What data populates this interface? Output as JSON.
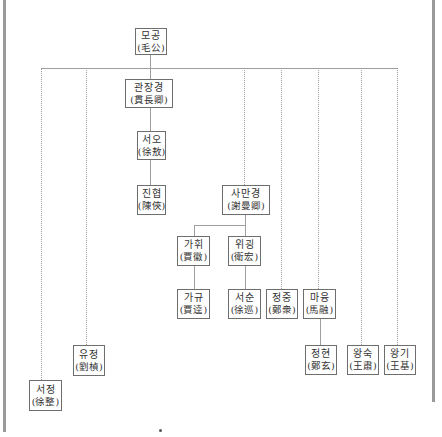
{
  "diagram": {
    "type": "family-lineage-tree",
    "nodes": [
      {
        "id": "mogong",
        "korean": "모공",
        "hanja": "(毛公)"
      },
      {
        "id": "gwanjanggyeong",
        "korean": "관장경",
        "hanja": "(貫長卿)"
      },
      {
        "id": "seoo",
        "korean": "서오",
        "hanja": "(徐敖)"
      },
      {
        "id": "jinhyeop",
        "korean": "진협",
        "hanja": "(陳俠)"
      },
      {
        "id": "samangyeong",
        "korean": "사만경",
        "hanja": "(謝曼卿)"
      },
      {
        "id": "gahwi",
        "korean": "가휘",
        "hanja": "(賈徽)"
      },
      {
        "id": "wigoeng",
        "korean": "위굉",
        "hanja": "(衛宏)"
      },
      {
        "id": "gagyu",
        "korean": "가규",
        "hanja": "(賈逵)"
      },
      {
        "id": "seosun",
        "korean": "서순",
        "hanja": "(徐巡)"
      },
      {
        "id": "jeongjung",
        "korean": "정중",
        "hanja": "(鄭衆)"
      },
      {
        "id": "mayung",
        "korean": "마융",
        "hanja": "(馬融)"
      },
      {
        "id": "jeonghyeon",
        "korean": "정현",
        "hanja": "(鄭玄)"
      },
      {
        "id": "wangsuk",
        "korean": "왕숙",
        "hanja": "(王肅)"
      },
      {
        "id": "wanggi",
        "korean": "왕기",
        "hanja": "(王基)"
      },
      {
        "id": "yujeong",
        "korean": "유정",
        "hanja": "(劉楨)"
      },
      {
        "id": "seojeong",
        "korean": "서정",
        "hanja": "(徐整)"
      }
    ],
    "edges": [
      [
        "mogong",
        "gwanjanggyeong"
      ],
      [
        "gwanjanggyeong",
        "seoo"
      ],
      [
        "seoo",
        "jinhyeop"
      ],
      [
        "mogong",
        "samangyeong"
      ],
      [
        "samangyeong",
        "gahwi"
      ],
      [
        "samangyeong",
        "wigoeng"
      ],
      [
        "gahwi",
        "gagyu"
      ],
      [
        "wigoeng",
        "seosun"
      ],
      [
        "mogong",
        "jeongjung"
      ],
      [
        "mogong",
        "mayung"
      ],
      [
        "mayung",
        "jeonghyeon"
      ],
      [
        "mogong",
        "wangsuk"
      ],
      [
        "mogong",
        "wanggi"
      ],
      [
        "mogong",
        "yujeong"
      ],
      [
        "mogong",
        "seojeong"
      ]
    ],
    "colors": {
      "line": "#9f9f9f",
      "box_border": "#6e6e6e",
      "side_border": "#9a9a9a"
    }
  }
}
